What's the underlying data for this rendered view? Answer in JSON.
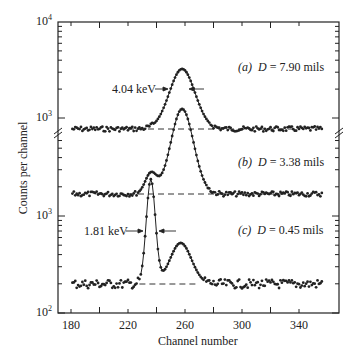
{
  "chart_data": {
    "type": "scatter",
    "title": "",
    "xlabel": "Channel number",
    "ylabel": "Counts per channel",
    "xlim": [
      172,
      368
    ],
    "x_ticks": [
      180,
      220,
      260,
      300,
      340
    ],
    "y_scale": "log (broken axis, three offset panels)",
    "y_tick_labels": [
      "10^4",
      "10^3",
      "10^3",
      "10^2"
    ],
    "grid": false,
    "series": [
      {
        "name": "(a) D = 7.90 mils",
        "label": "(a)",
        "D": "7.90 mils",
        "fwhm_label": "4.04 keV",
        "baseline": 800,
        "peaks": [
          {
            "channel": 258,
            "counts": 3300
          }
        ],
        "x": [
          181,
          190,
          200,
          210,
          220,
          230,
          240,
          245,
          250,
          254,
          258,
          262,
          266,
          270,
          280,
          300,
          320,
          340,
          356
        ],
        "y": [
          800,
          790,
          810,
          795,
          805,
          820,
          830,
          900,
          1500,
          2700,
          3300,
          2600,
          1400,
          850,
          800,
          790,
          800,
          795,
          790
        ]
      },
      {
        "name": "(b) D = 3.38 mils",
        "label": "(b)",
        "D": "3.38 mils",
        "baseline": 1500,
        "peaks": [
          {
            "channel": 236,
            "counts": 2400
          },
          {
            "channel": 258,
            "counts": 5000
          }
        ],
        "x": [
          181,
          200,
          220,
          230,
          234,
          236,
          240,
          244,
          250,
          254,
          258,
          262,
          266,
          270,
          300,
          340,
          356
        ],
        "y": [
          1500,
          1500,
          1500,
          1700,
          2300,
          2400,
          1900,
          1800,
          3000,
          4500,
          5000,
          4300,
          2500,
          1550,
          1500,
          1500,
          1500
        ]
      },
      {
        "name": "(c) D = 0.45 mils",
        "label": "(c)",
        "D": "0.45 mils",
        "fwhm_label": "1.81 keV",
        "baseline": 200,
        "peaks": [
          {
            "channel": 236,
            "counts": 1200
          },
          {
            "channel": 257,
            "counts": 500
          }
        ],
        "x": [
          181,
          200,
          220,
          228,
          231,
          234,
          236,
          238,
          240,
          242,
          246,
          250,
          254,
          257,
          260,
          264,
          268,
          272,
          300,
          340,
          356
        ],
        "y": [
          200,
          200,
          195,
          210,
          400,
          900,
          1200,
          950,
          500,
          260,
          270,
          380,
          470,
          500,
          460,
          320,
          210,
          190,
          190,
          190,
          185
        ]
      }
    ],
    "annotations": [
      "4.04 keV",
      "1.81 keV",
      "(a)  D = 7.90 mils",
      "(b)  D = 3.38 mils",
      "(c)  D = 0.45 mils"
    ]
  },
  "labels": {
    "xlabel": "Channel number",
    "ylabel": "Counts per channel",
    "x_ticks": [
      "180",
      "220",
      "260",
      "300",
      "340"
    ],
    "y_top_base": "10",
    "y_top_exp": "4",
    "y_mid_base": "10",
    "y_mid_exp": "3",
    "y_low_base": "10",
    "y_low_exp": "3",
    "y_bot_base": "10",
    "y_bot_exp": "2",
    "fwhm_a": "4.04 keV",
    "fwhm_c": "1.81 keV",
    "a_tag": "(a)",
    "a_D": "D",
    "a_val": "= 7.90 mils",
    "b_tag": "(b)",
    "b_D": "D",
    "b_val": "= 3.38 mils",
    "c_tag": "(c)",
    "c_D": "D",
    "c_val": "= 0.45 mils"
  }
}
